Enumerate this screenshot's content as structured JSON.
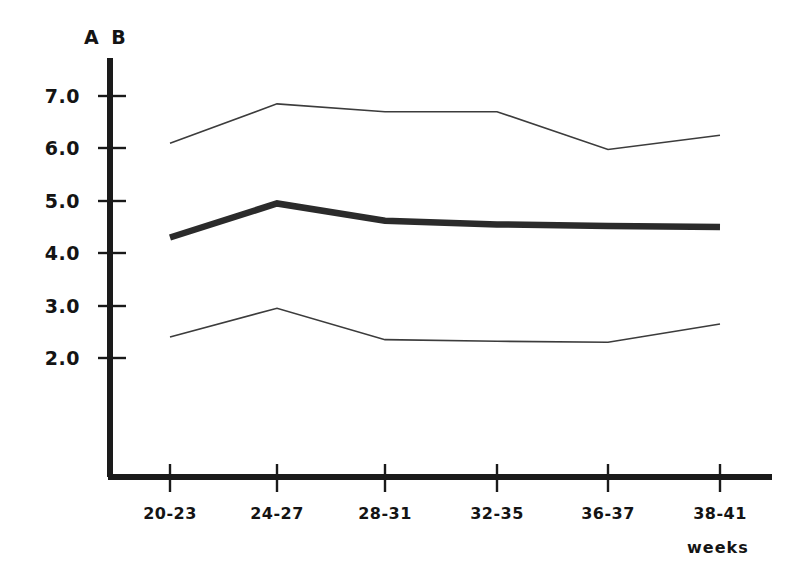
{
  "chart_data": {
    "type": "line",
    "title": "",
    "subtitle": "",
    "xlabel": "weeks",
    "ylabel": "A B",
    "categories": [
      "20-23",
      "24-27",
      "28-31",
      "32-35",
      "36-37",
      "38-41"
    ],
    "yticks": [
      "2.0",
      "3.0",
      "4.0",
      "5.0",
      "6.0",
      "7.0"
    ],
    "ytick_values": [
      2.0,
      3.0,
      4.0,
      5.0,
      6.0,
      7.0
    ],
    "ylim": [
      0.0,
      7.6
    ],
    "xlim": [
      0,
      5
    ],
    "grid": false,
    "legend": "none",
    "series": [
      {
        "name": "upper-bound",
        "style": "thin",
        "color": "#3c3c3c",
        "width": 1.6,
        "values": [
          6.1,
          6.85,
          6.7,
          6.7,
          5.98,
          6.25
        ]
      },
      {
        "name": "mean",
        "style": "thick",
        "color": "#2b2b2b",
        "width": 6.5,
        "values": [
          4.3,
          4.95,
          4.62,
          4.55,
          4.52,
          4.5
        ]
      },
      {
        "name": "lower-bound",
        "style": "thin",
        "color": "#3c3c3c",
        "width": 1.6,
        "values": [
          2.4,
          2.95,
          2.35,
          2.32,
          2.3,
          2.65
        ]
      }
    ]
  },
  "axes": {
    "y_axis_label": "A B",
    "x_axis_label": "weeks",
    "axis_color": "#1a1a1a"
  }
}
